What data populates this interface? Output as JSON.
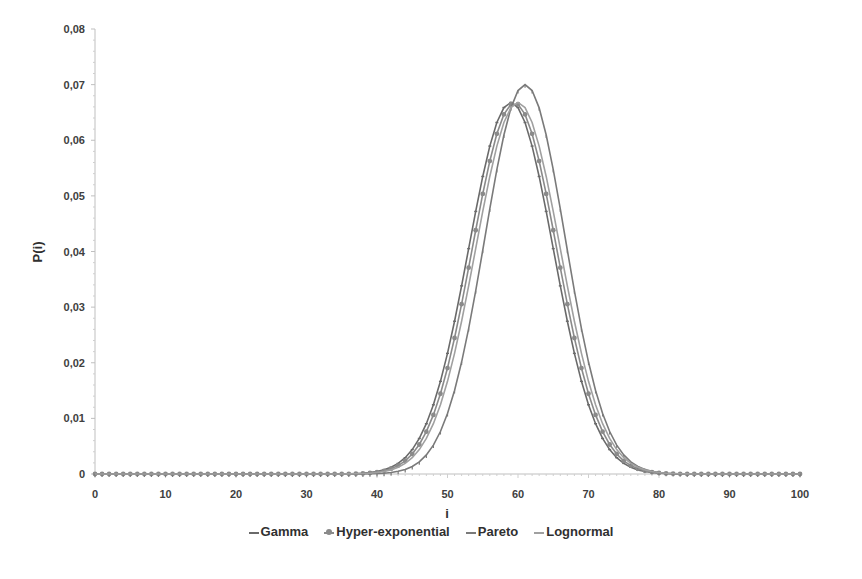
{
  "chart_data": {
    "type": "line",
    "title": "",
    "xlabel": "i",
    "ylabel": "P(i)",
    "xlim": [
      0,
      100
    ],
    "ylim": [
      0,
      0.08
    ],
    "x_ticks": [
      "0",
      "10",
      "20",
      "30",
      "40",
      "50",
      "60",
      "70",
      "80",
      "90",
      "100"
    ],
    "y_ticks": [
      "0",
      "0,01",
      "0,02",
      "0,03",
      "0,04",
      "0,05",
      "0,06",
      "0,07",
      "0,08"
    ],
    "grid": false,
    "legend_position": "bottom",
    "series": [
      {
        "name": "Gamma",
        "color": "#6a6a6a",
        "marker": "dash",
        "peak_x": 59,
        "peak_y": 0.0668,
        "sigma": 6.0
      },
      {
        "name": "Hyper-exponential",
        "color": "#8a8a8a",
        "marker": "circle",
        "peak_x": 59.5,
        "peak_y": 0.0667,
        "sigma": 6.0
      },
      {
        "name": "Pareto",
        "color": "#7a7a7a",
        "marker": "tick",
        "peak_x": 61,
        "peak_y": 0.07,
        "sigma": 5.7
      },
      {
        "name": "Lognormal",
        "color": "#a0a0a0",
        "marker": "none",
        "peak_x": 60,
        "peak_y": 0.0668,
        "sigma": 6.0
      }
    ],
    "x": "integers 0..100",
    "note": "Each series is a bell-shaped distribution; values ~0 for i<38 and i>80."
  },
  "legend": {
    "items": [
      "Gamma",
      "Hyper-exponential",
      "Pareto",
      "Lognormal"
    ]
  }
}
